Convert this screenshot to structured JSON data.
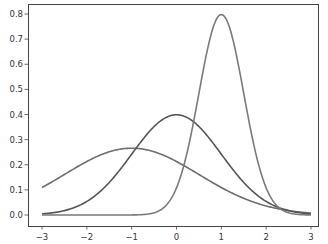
{
  "chart_data": {
    "type": "line",
    "title": "",
    "xlabel": "",
    "ylabel": "",
    "xlim": [
      -3.3,
      3.3
    ],
    "ylim": [
      -0.04,
      0.84
    ],
    "grid": false,
    "legend": null,
    "xticks": [
      -3,
      -2,
      -1,
      0,
      1,
      2,
      3
    ],
    "xtick_labels": [
      "−3",
      "−2",
      "−1",
      "0",
      "1",
      "2",
      "3"
    ],
    "yticks": [
      0.0,
      0.1,
      0.2,
      0.3,
      0.4,
      0.5,
      0.6,
      0.7,
      0.8
    ],
    "ytick_labels": [
      "0.0",
      "0.1",
      "0.2",
      "0.3",
      "0.4",
      "0.5",
      "0.6",
      "0.7",
      "0.8"
    ],
    "series": [
      {
        "name": "normal pdf mu=-1 sigma=1.5",
        "mu": -1,
        "sigma": 1.5,
        "x_range": [
          -3,
          3
        ],
        "peak": 0.266,
        "color": "#6e6e6e"
      },
      {
        "name": "normal pdf mu=0 sigma=1",
        "mu": 0,
        "sigma": 1,
        "x_range": [
          -3,
          3
        ],
        "peak": 0.399,
        "color": "#555555"
      },
      {
        "name": "normal pdf mu=1 sigma=0.5",
        "mu": 1,
        "sigma": 0.5,
        "x_range": [
          -3,
          3
        ],
        "peak": 0.798,
        "color": "#7a7a7a"
      }
    ]
  },
  "layout": {
    "plot": {
      "left": 28,
      "top": 4,
      "right": 318,
      "bottom": 226
    },
    "x_px": {
      "at_-3": 42,
      "at_3": 311
    },
    "y_px": {
      "at_0": 215,
      "at_0.8": 14
    }
  }
}
